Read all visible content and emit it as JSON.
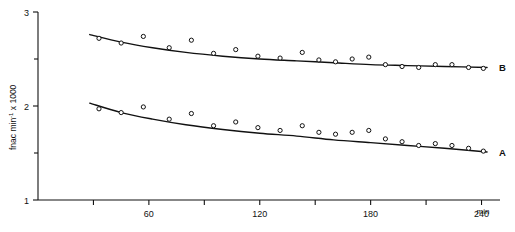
{
  "chart_data": {
    "type": "scatter",
    "title": "",
    "subtitle": "",
    "xlabel": "min",
    "ylabel": "fnac min-1 x 1000",
    "ylabel_parts": {
      "main": "fnac min",
      "exponent": "-1",
      "tail": " x 1000"
    },
    "xlim": [
      0,
      250
    ],
    "ylim": [
      1,
      3
    ],
    "grid": false,
    "legend_position": "right-inline",
    "x_ticks": [
      0,
      30,
      60,
      90,
      120,
      150,
      180,
      210,
      240
    ],
    "x_tick_labels": [
      "",
      "",
      "60",
      "",
      "120",
      "",
      "180",
      "",
      "240"
    ],
    "y_ticks": [
      1,
      1.5,
      2,
      2.5,
      3
    ],
    "y_tick_labels": [
      "1",
      "",
      "2",
      "",
      "3"
    ],
    "x_unit": "min",
    "series": [
      {
        "name": "B",
        "label": "B",
        "marker": "open-circle",
        "color": "#111111",
        "points": [
          {
            "x": 33,
            "y": 2.72
          },
          {
            "x": 45,
            "y": 2.67
          },
          {
            "x": 57,
            "y": 2.74
          },
          {
            "x": 71,
            "y": 2.62
          },
          {
            "x": 83,
            "y": 2.7
          },
          {
            "x": 95,
            "y": 2.56
          },
          {
            "x": 107,
            "y": 2.6
          },
          {
            "x": 119,
            "y": 2.53
          },
          {
            "x": 131,
            "y": 2.51
          },
          {
            "x": 143,
            "y": 2.57
          },
          {
            "x": 152,
            "y": 2.49
          },
          {
            "x": 161,
            "y": 2.47
          },
          {
            "x": 170,
            "y": 2.5
          },
          {
            "x": 179,
            "y": 2.52
          },
          {
            "x": 188,
            "y": 2.44
          },
          {
            "x": 197,
            "y": 2.42
          },
          {
            "x": 206,
            "y": 2.41
          },
          {
            "x": 215,
            "y": 2.44
          },
          {
            "x": 224,
            "y": 2.44
          },
          {
            "x": 233,
            "y": 2.41
          },
          {
            "x": 241,
            "y": 2.4
          }
        ],
        "fit_curve": [
          {
            "x": 28,
            "y": 2.76
          },
          {
            "x": 45,
            "y": 2.68
          },
          {
            "x": 62,
            "y": 2.62
          },
          {
            "x": 80,
            "y": 2.57
          },
          {
            "x": 100,
            "y": 2.53
          },
          {
            "x": 120,
            "y": 2.5
          },
          {
            "x": 140,
            "y": 2.48
          },
          {
            "x": 160,
            "y": 2.46
          },
          {
            "x": 180,
            "y": 2.44
          },
          {
            "x": 200,
            "y": 2.43
          },
          {
            "x": 220,
            "y": 2.42
          },
          {
            "x": 243,
            "y": 2.41
          }
        ]
      },
      {
        "name": "A",
        "label": "A",
        "marker": "open-circle",
        "color": "#111111",
        "points": [
          {
            "x": 33,
            "y": 1.97
          },
          {
            "x": 45,
            "y": 1.93
          },
          {
            "x": 57,
            "y": 1.99
          },
          {
            "x": 71,
            "y": 1.86
          },
          {
            "x": 83,
            "y": 1.92
          },
          {
            "x": 95,
            "y": 1.79
          },
          {
            "x": 107,
            "y": 1.83
          },
          {
            "x": 119,
            "y": 1.77
          },
          {
            "x": 131,
            "y": 1.74
          },
          {
            "x": 143,
            "y": 1.79
          },
          {
            "x": 152,
            "y": 1.72
          },
          {
            "x": 161,
            "y": 1.7
          },
          {
            "x": 170,
            "y": 1.72
          },
          {
            "x": 179,
            "y": 1.74
          },
          {
            "x": 188,
            "y": 1.65
          },
          {
            "x": 197,
            "y": 1.62
          },
          {
            "x": 206,
            "y": 1.58
          },
          {
            "x": 215,
            "y": 1.6
          },
          {
            "x": 224,
            "y": 1.58
          },
          {
            "x": 233,
            "y": 1.55
          },
          {
            "x": 241,
            "y": 1.52
          }
        ],
        "fit_curve": [
          {
            "x": 28,
            "y": 2.03
          },
          {
            "x": 45,
            "y": 1.93
          },
          {
            "x": 62,
            "y": 1.86
          },
          {
            "x": 80,
            "y": 1.8
          },
          {
            "x": 100,
            "y": 1.75
          },
          {
            "x": 120,
            "y": 1.71
          },
          {
            "x": 140,
            "y": 1.68
          },
          {
            "x": 160,
            "y": 1.64
          },
          {
            "x": 180,
            "y": 1.61
          },
          {
            "x": 200,
            "y": 1.58
          },
          {
            "x": 220,
            "y": 1.55
          },
          {
            "x": 243,
            "y": 1.51
          }
        ]
      }
    ]
  }
}
